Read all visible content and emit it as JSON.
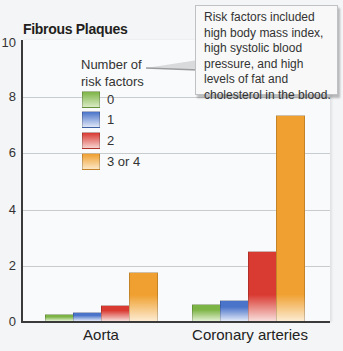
{
  "chart_data": {
    "type": "bar",
    "title": "Fibrous Plaques",
    "xlabel": "",
    "ylabel": "",
    "ylim": [
      0,
      10
    ],
    "yticks": [
      0,
      2,
      4,
      6,
      8,
      10
    ],
    "grid": true,
    "categories": [
      "Aorta",
      "Coronary arteries"
    ],
    "legend_title": "Number of risk factors",
    "legend_position": "upper-left inside",
    "series": [
      {
        "name": "0",
        "color": "#7db446",
        "values": [
          0.3,
          0.65
        ]
      },
      {
        "name": "1",
        "color": "#4a74c9",
        "values": [
          0.35,
          0.8
        ]
      },
      {
        "name": "2",
        "color": "#d93a32",
        "values": [
          0.6,
          2.55
        ]
      },
      {
        "name": "3 or 4",
        "color": "#f0a030",
        "values": [
          1.8,
          7.4
        ]
      }
    ],
    "annotation": "Risk factors included high body mass index, high systolic blood pressure, and high levels of fat and cholesterol in the blood."
  },
  "labels": {
    "title": "Fibrous Plaques",
    "legend_title_line1": "Number of",
    "legend_title_line2": "risk factors",
    "legend": [
      "0",
      "1",
      "2",
      "3 or 4"
    ],
    "yticks": [
      "10",
      "8",
      "6",
      "4",
      "2",
      "0"
    ],
    "categories": [
      "Aorta",
      "Coronary arteries"
    ],
    "callout": "Risk factors included high body mass index, high systolic blood pressure, and high levels of fat and cholesterol in the blood."
  }
}
